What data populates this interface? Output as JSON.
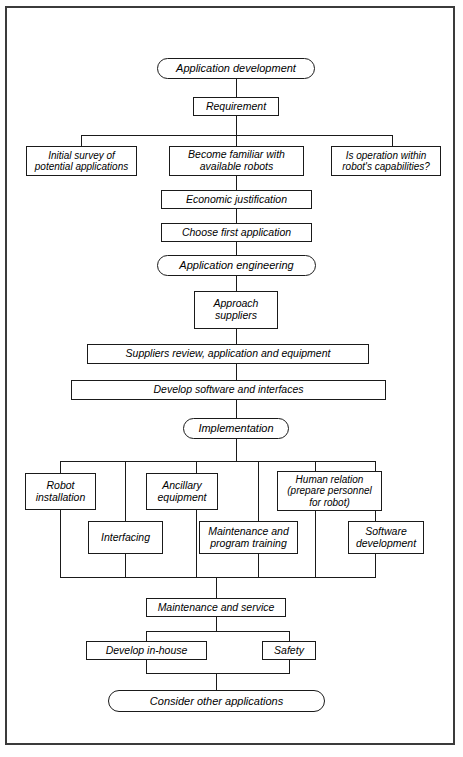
{
  "diagram": {
    "type": "flowchart",
    "orientation": "top-to-bottom",
    "style": {
      "border_color": "#1a1a1a",
      "frame_color": "#3a3a3a",
      "background": "#ffffff",
      "text_style": "italic"
    },
    "nodes": {
      "application_development": "Application development",
      "requirement": "Requirement",
      "initial_survey": "Initial survey of\npotential applications",
      "become_familiar": "Become familiar with\navailable robots",
      "is_operation_within": "Is operation within\nrobot's capabilities?",
      "economic_justification": "Economic justification",
      "choose_first_application": "Choose first application",
      "application_engineering": "Application engineering",
      "approach_suppliers": "Approach\nsuppliers",
      "suppliers_review": "Suppliers  review, application and equipment",
      "develop_software": "Develop software and interfaces",
      "implementation": "Implementation",
      "robot_installation": "Robot\ninstallation",
      "ancillary_equipment": "Ancillary\nequipment",
      "human_relation": "Human relation\n(prepare personnel\nfor robot)",
      "interfacing": "Interfacing",
      "maintenance_program_training": "Maintenance and\nprogram training",
      "software_development": "Software\ndevelopment",
      "maintenance_and_service": "Maintenance and service",
      "develop_in_house": "Develop in-house",
      "safety": "Safety",
      "consider_other_applications": "Consider other applications"
    }
  }
}
